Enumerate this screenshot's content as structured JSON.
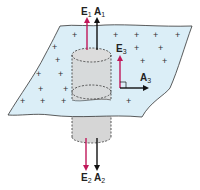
{
  "diagram": {
    "colors": {
      "sheet_fill": "#dbeef7",
      "sheet_stroke": "#333333",
      "cylinder_fill": "#d6d6d6",
      "cylinder_stroke": "#333333",
      "field_vector": "#c0185a",
      "area_vector": "#111111"
    },
    "sheet": {
      "charge_symbol": "+",
      "charge_sign": "positive"
    },
    "vectors": {
      "E1": {
        "letter": "E",
        "subscript": "1",
        "direction": "up"
      },
      "A1": {
        "letter": "A",
        "subscript": "1",
        "direction": "up"
      },
      "E2": {
        "letter": "E",
        "subscript": "2",
        "direction": "down"
      },
      "A2": {
        "letter": "A",
        "subscript": "2",
        "direction": "down"
      },
      "E3": {
        "letter": "E",
        "subscript": "3",
        "direction": "up"
      },
      "A3": {
        "letter": "A",
        "subscript": "3",
        "direction": "right"
      }
    }
  }
}
